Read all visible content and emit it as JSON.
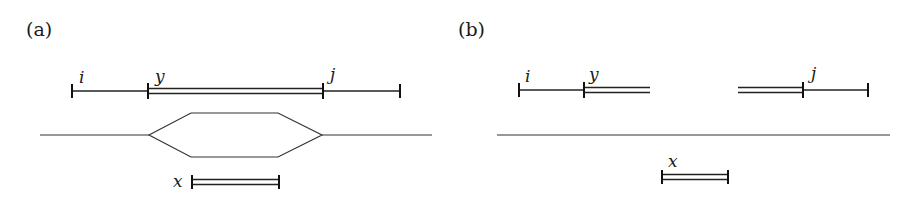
{
  "figure": {
    "panels": [
      {
        "id": "a",
        "label": "(a)",
        "segment_labels": {
          "i": "i",
          "y": "y",
          "j": "j",
          "x": "x"
        },
        "description": "Interval i..j with sub-interval y (double line) aligned to a bubble in the graph path; x (double line) lies under the bubble"
      },
      {
        "id": "b",
        "label": "(b)",
        "segment_labels": {
          "i": "i",
          "y": "y",
          "j": "j",
          "x": "x"
        },
        "description": "Interval i..j with y split into two double-line pieces; straight baseline; x (double line) below"
      }
    ]
  }
}
